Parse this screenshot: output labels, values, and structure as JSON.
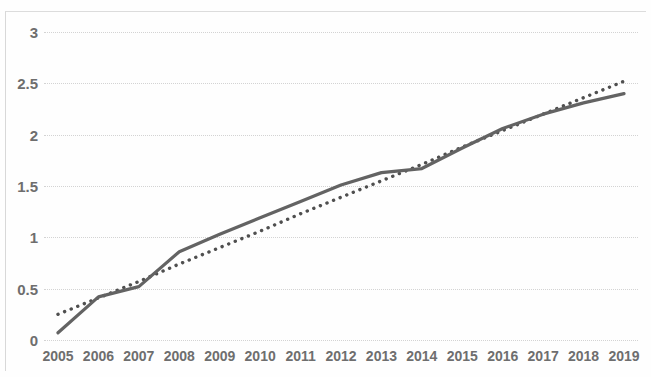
{
  "chart_data": {
    "type": "line",
    "title": "",
    "subtitle": "",
    "xlabel": "",
    "ylabel": "",
    "categories": [
      "2005",
      "2006",
      "2007",
      "2008",
      "2009",
      "2010",
      "2011",
      "2012",
      "2013",
      "2014",
      "2015",
      "2016",
      "2017",
      "2018",
      "2019"
    ],
    "x_tick_labels": [
      "2005",
      "2006",
      "2007",
      "2008",
      "2009",
      "2010",
      "2011",
      "2012",
      "2013",
      "2014",
      "2015",
      "2016",
      "2017",
      "2018",
      "2019"
    ],
    "y_tick_labels": [
      "0",
      "0.5",
      "1",
      "1.5",
      "2",
      "2.5",
      "3"
    ],
    "y_ticks": [
      0,
      0.5,
      1,
      1.5,
      2,
      2.5,
      3
    ],
    "ylim": [
      0,
      3
    ],
    "xlim": [
      2005,
      2019
    ],
    "grid": true,
    "grid_axis": "y",
    "legend": false,
    "legend_position": "none",
    "series": [
      {
        "name": "data",
        "style": "solid",
        "color": "#636363",
        "values": [
          0.07,
          0.42,
          0.52,
          0.86,
          1.03,
          1.19,
          1.35,
          1.51,
          1.63,
          1.67,
          1.87,
          2.06,
          2.2,
          2.31,
          2.4
        ]
      },
      {
        "name": "trendline",
        "style": "dotted",
        "color": "#4f4f4f",
        "values": [
          0.25,
          0.41,
          0.57,
          0.74,
          0.9,
          1.06,
          1.23,
          1.39,
          1.55,
          1.71,
          1.88,
          2.04,
          2.2,
          2.36,
          2.52
        ]
      }
    ],
    "colors": {
      "series_line": "#636363",
      "trendline": "#4f4f4f",
      "gridline": "#d3d3d3",
      "tick_label": "#6e6e6e",
      "background": "#fefefe",
      "frame": "#d8d8d8"
    }
  }
}
